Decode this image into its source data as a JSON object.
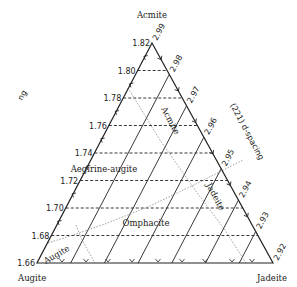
{
  "diagram": {
    "vertices": {
      "top": "Acmite",
      "bottom_left": "Augite",
      "bottom_right": "Jadeite"
    },
    "left_axis": {
      "title": "ng",
      "ticks": [
        "1.82",
        "1.80",
        "1.78",
        "1.76",
        "1.74",
        "1.72",
        "1.70",
        "1.68",
        "1.66"
      ]
    },
    "right_axis": {
      "title": "(221) d-spacing",
      "ticks": [
        "2.99",
        "2.98",
        "2.97",
        "2.96",
        "2.95",
        "2.94",
        "2.93",
        "2.92"
      ]
    },
    "fields": {
      "acmite": "Acmite",
      "aegirine_augite": "Aegirine-augite",
      "omphacite": "Omphacite",
      "jadeite": "Jadeite",
      "augite": "Augite"
    },
    "line_styles": {
      "ng_contours": "dashed",
      "d_spacing_contours": "solid",
      "field_boundaries": "dotted"
    },
    "colors": {
      "line": "#222222",
      "boundary": "#888888"
    }
  }
}
